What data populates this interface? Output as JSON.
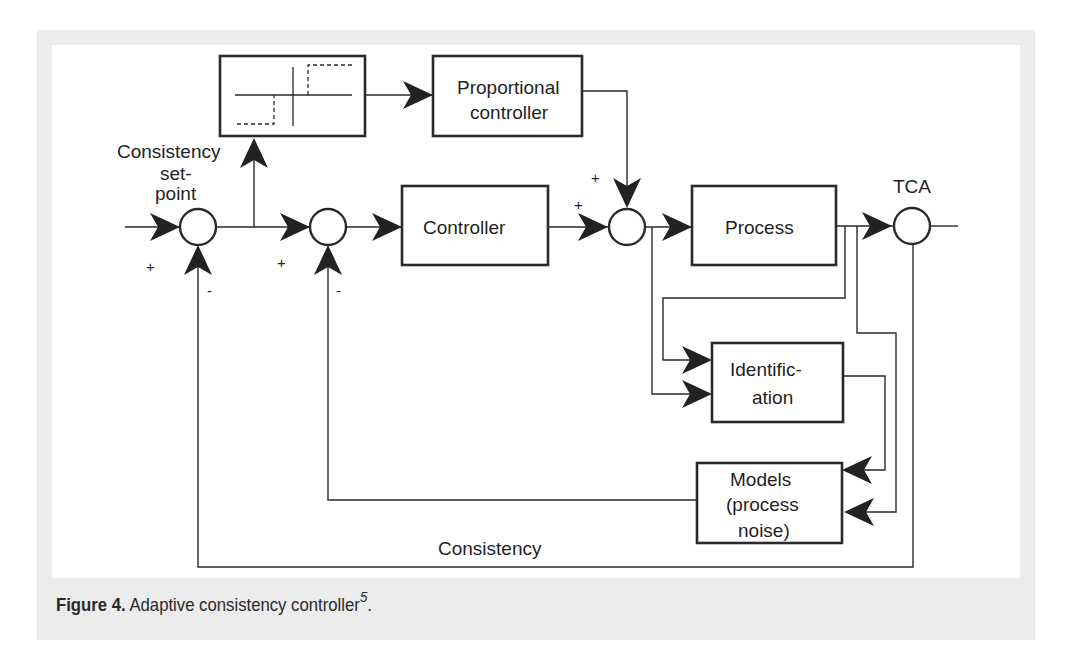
{
  "figure": {
    "caption_label": "Figure 4.",
    "caption_text": " Adaptive consistency controller",
    "caption_ref": "5",
    "caption_end": "."
  },
  "blocks": {
    "step_function": {
      "label": ""
    },
    "proportional_controller": {
      "line1": "Proportional",
      "line2": "controller"
    },
    "controller": {
      "label": "Controller"
    },
    "process": {
      "label": "Process"
    },
    "identification": {
      "line1": "Identific-",
      "line2": "ation"
    },
    "models": {
      "line1": "Models",
      "line2": "(process",
      "line3": "noise)"
    }
  },
  "labels": {
    "setpoint_line1": "Consistency",
    "setpoint_line2": "set-",
    "setpoint_line3": "point",
    "output": "TCA",
    "feedback": "Consistency",
    "plus": "+",
    "minus": "-"
  },
  "colors": {
    "frame": "#ececec",
    "line": "#2a2a2a",
    "arrow": "#222222",
    "text": "#1f1f1f"
  }
}
